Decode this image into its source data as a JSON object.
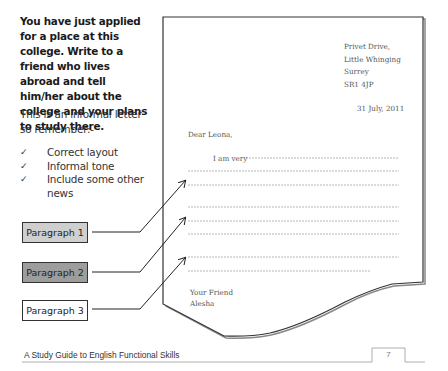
{
  "task": {
    "prompt": "You have just applied for a place at this college.  Write to a friend who lives abroad and tell him/her about the college and your plans to study there.",
    "remember_intro": "This is an informal letter so remember:-",
    "checklist": [
      {
        "icon": "check-icon",
        "text": "Correct layout"
      },
      {
        "icon": "check-icon",
        "text": "Informal tone"
      },
      {
        "icon": "check-icon",
        "text": "Include some other news"
      }
    ],
    "tick_glyph": "✓"
  },
  "paragraph_labels": [
    {
      "label": "Paragraph 1",
      "fill": "#cfcfcf"
    },
    {
      "label": "Paragraph 2",
      "fill": "#9d9d9d"
    },
    {
      "label": "Paragraph 3",
      "fill": "#ffffff"
    }
  ],
  "letter": {
    "address_lines": [
      "Privet Drive,",
      "Little Whinging",
      "Surrey",
      "SR1 4JP"
    ],
    "date": "31 July, 2011",
    "greeting": "Dear Leona,",
    "opening": "I am very",
    "signoff": [
      "Your Friend",
      "Alesha"
    ]
  },
  "footer": {
    "title": "A Study Guide to English Functional Skills",
    "page_number": "7"
  }
}
